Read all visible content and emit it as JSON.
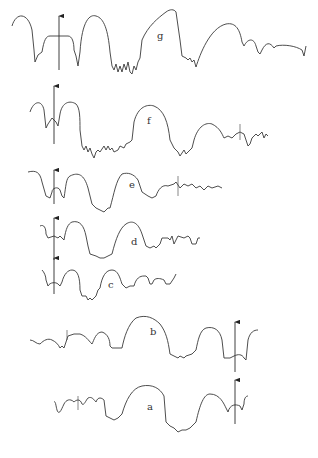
{
  "figure": {
    "traces": [
      {
        "label": "g"
      },
      {
        "label": "f"
      },
      {
        "label": "e"
      },
      {
        "label": "d"
      },
      {
        "label": "c"
      },
      {
        "label": "b"
      },
      {
        "label": "a"
      }
    ],
    "marker": "up-arrow",
    "colors": {
      "line": "#3a3a3a",
      "background": "#ffffff"
    }
  }
}
